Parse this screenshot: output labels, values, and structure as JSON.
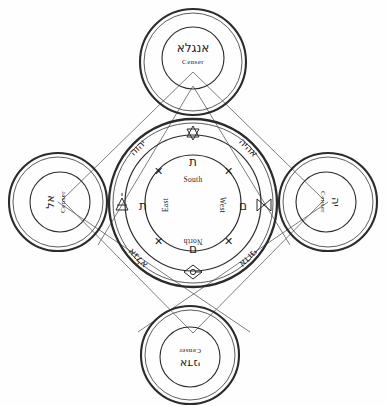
{
  "diagram": {
    "ink_color": "#2b2b2b",
    "background": "#fefefe"
  },
  "censers": {
    "top": {
      "hebrew": "אנגלא",
      "label": "Censer",
      "position": "top"
    },
    "left": {
      "hebrew": "אל",
      "label": "Censer",
      "position": "left"
    },
    "right": {
      "hebrew": "יה",
      "label": "Censer",
      "position": "right"
    },
    "bottom": {
      "hebrew": "אדני",
      "label": "Censer",
      "position": "bottom"
    }
  },
  "outer_ring_names": {
    "upper_left": "יהוה",
    "upper_right": "אהיה",
    "lower_left": "אגלא",
    "lower_right": "אדוני"
  },
  "sigils": {
    "top": "hexagram-sigil",
    "left": "triangle-sigil",
    "right": "bowtie-sigil",
    "bottom": "diamond-sigil"
  },
  "inner_letters": {
    "top": "ת",
    "left": "ת",
    "right": "ם",
    "bottom": "ם"
  },
  "directions": {
    "top": "South",
    "left": "East",
    "right": "West",
    "bottom": "North"
  },
  "crosses": {
    "count": 4,
    "glyph": "✕",
    "positions": [
      "upper-left",
      "upper-right",
      "lower-left",
      "lower-right"
    ]
  }
}
